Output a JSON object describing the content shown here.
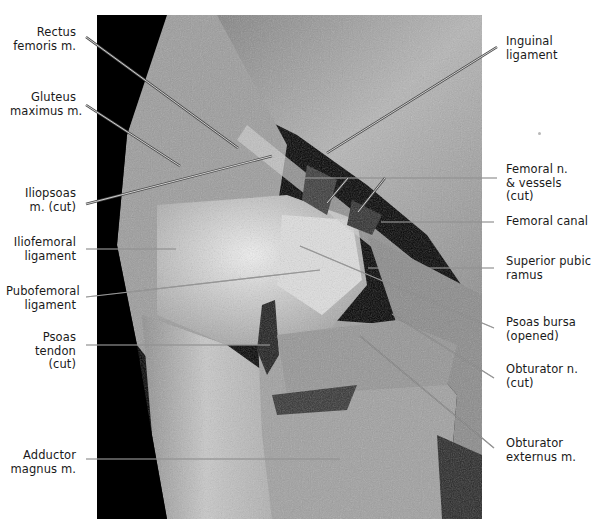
{
  "figure": {
    "photo_colors": {
      "background": "#000000",
      "tissue_light": "#d9d9d9",
      "tissue_mid": "#9a9a9a",
      "tissue_dark": "#5a5a5a"
    },
    "labels_left": [
      {
        "id": "rectus-femoris",
        "lines": [
          "Rectus",
          "femoris m."
        ],
        "x": 12,
        "y": 26,
        "w": 64
      },
      {
        "id": "gluteus-maximus",
        "lines": [
          "Gluteus",
          "maximus m."
        ],
        "x": 10,
        "y": 91,
        "w": 66
      },
      {
        "id": "iliopsoas",
        "lines": [
          "Iliopsoas",
          "m. (cut)"
        ],
        "x": 10,
        "y": 187,
        "w": 66
      },
      {
        "id": "iliofemoral-ligament",
        "lines": [
          "Iliofemoral",
          "ligament"
        ],
        "x": 10,
        "y": 236,
        "w": 66
      },
      {
        "id": "pubofemoral-ligament",
        "lines": [
          "Pubofemoral",
          "ligament"
        ],
        "x": 6,
        "y": 285,
        "w": 70
      },
      {
        "id": "psoas-tendon",
        "lines": [
          "Psoas",
          "tendon",
          "(cut)"
        ],
        "x": 10,
        "y": 331,
        "w": 66
      },
      {
        "id": "adductor-magnus",
        "lines": [
          "Adductor",
          "magnus m."
        ],
        "x": 10,
        "y": 449,
        "w": 66
      }
    ],
    "labels_right": [
      {
        "id": "inguinal-ligament",
        "lines": [
          "Inguinal",
          "ligament"
        ],
        "x": 506,
        "y": 35
      },
      {
        "id": "femoral-nerve-vessels",
        "lines": [
          "Femoral n.",
          "& vessels",
          "(cut)"
        ],
        "x": 506,
        "y": 163
      },
      {
        "id": "femoral-canal",
        "lines": [
          "Femoral canal"
        ],
        "x": 506,
        "y": 215
      },
      {
        "id": "superior-pubic-ramus",
        "lines": [
          "Superior pubic",
          "ramus"
        ],
        "x": 506,
        "y": 255
      },
      {
        "id": "psoas-bursa",
        "lines": [
          "Psoas bursa",
          "(opened)"
        ],
        "x": 506,
        "y": 316
      },
      {
        "id": "obturator-nerve",
        "lines": [
          "Obturator n.",
          "(cut)"
        ],
        "x": 506,
        "y": 363
      },
      {
        "id": "obturator-externus",
        "lines": [
          "Obturator",
          "externus m."
        ],
        "x": 506,
        "y": 437
      }
    ],
    "leaders": [
      {
        "for": "rectus-femoris",
        "x1": 86,
        "y1": 37,
        "x2": 238,
        "y2": 148,
        "double": true
      },
      {
        "for": "gluteus-maximus",
        "x1": 86,
        "y1": 105,
        "x2": 180,
        "y2": 166,
        "double": true
      },
      {
        "for": "iliopsoas",
        "x1": 86,
        "y1": 204,
        "x2": 272,
        "y2": 156,
        "double": true
      },
      {
        "for": "iliofemoral-ligament",
        "x1": 86,
        "y1": 249,
        "x2": 176,
        "y2": 249,
        "double": false
      },
      {
        "for": "pubofemoral-ligament",
        "x1": 86,
        "y1": 297,
        "x2": 320,
        "y2": 270,
        "double": false
      },
      {
        "for": "psoas-tendon",
        "x1": 86,
        "y1": 345,
        "x2": 270,
        "y2": 345,
        "double": false
      },
      {
        "for": "adductor-magnus",
        "x1": 86,
        "y1": 459,
        "x2": 340,
        "y2": 459,
        "double": false
      },
      {
        "for": "inguinal-ligament",
        "x1": 497,
        "y1": 47,
        "x2": 327,
        "y2": 153,
        "double": true
      },
      {
        "for": "femoral-nerve-vessels-a",
        "x1": 497,
        "y1": 178,
        "x2": 300,
        "y2": 178,
        "double": false
      },
      {
        "for": "femoral-nerve-vessels-b",
        "x1": 348,
        "y1": 178,
        "x2": 327,
        "y2": 203,
        "double": true
      },
      {
        "for": "femoral-nerve-vessels-c",
        "x1": 385,
        "y1": 178,
        "x2": 358,
        "y2": 212,
        "double": true
      },
      {
        "for": "femoral-canal",
        "x1": 494,
        "y1": 222,
        "x2": 381,
        "y2": 222,
        "double": false
      },
      {
        "for": "superior-pubic-ramus",
        "x1": 494,
        "y1": 268,
        "x2": 368,
        "y2": 268,
        "double": false
      },
      {
        "for": "psoas-bursa",
        "x1": 494,
        "y1": 328,
        "x2": 300,
        "y2": 246,
        "double": false
      },
      {
        "for": "obturator-nerve",
        "x1": 494,
        "y1": 378,
        "x2": 392,
        "y2": 314,
        "double": false
      },
      {
        "for": "obturator-externus",
        "x1": 494,
        "y1": 448,
        "x2": 360,
        "y2": 336,
        "double": false
      }
    ]
  }
}
